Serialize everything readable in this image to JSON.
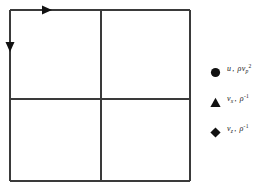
{
  "figure": {
    "type": "staggered-grid-stencil-diagram",
    "background_color": "#ffffff",
    "line_color": "#3a3a3a",
    "marker_color": "#111111",
    "grid": {
      "description": "2 by 2 cell grid square",
      "left": 10,
      "top": 10,
      "right": 190,
      "bottom": 181,
      "mid_x": 101,
      "mid_y": 99,
      "columns": 2,
      "rows": 2,
      "stroke_width": 1.4
    },
    "arrows": [
      {
        "name": "top-edge-arrow",
        "direction": "right",
        "x": 48,
        "y": 10
      },
      {
        "name": "left-edge-arrow",
        "direction": "down",
        "x": 10,
        "y": 48
      }
    ]
  },
  "legend": {
    "position": "right",
    "entries": [
      {
        "marker": "circle",
        "marker_name": "filled-circle-marker",
        "symbol": "u",
        "symbol_sub": "",
        "quantity": "ρv",
        "quantity_sub": "p",
        "quantity_sup": "2",
        "label_plain": "u ,  ρvₚ²"
      },
      {
        "marker": "triangle",
        "marker_name": "filled-triangle-marker",
        "symbol": "v",
        "symbol_sub": "x",
        "quantity": "ρ",
        "quantity_sub": "",
        "quantity_sup": "-1",
        "label_plain": "vₓ ,  ρ⁻¹"
      },
      {
        "marker": "diamond",
        "marker_name": "filled-diamond-marker",
        "symbol": "v",
        "symbol_sub": "z",
        "quantity": "ρ",
        "quantity_sub": "",
        "quantity_sup": "-1",
        "label_plain": "vᵩ ,  ρ⁻¹"
      }
    ]
  }
}
